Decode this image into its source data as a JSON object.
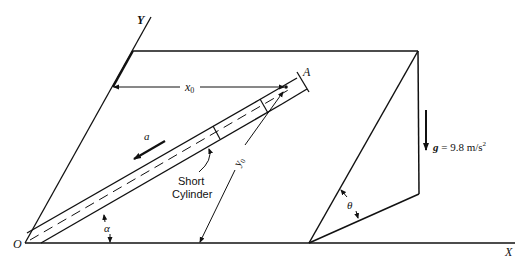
{
  "diagram": {
    "axes": {
      "y_label": "Y",
      "x_label": "X",
      "origin_label": "O"
    },
    "labels": {
      "point_a": "A",
      "x0": "x",
      "x0_sub": "0",
      "y0": "y",
      "y0_sub": "0",
      "accel": "a",
      "cylinder_line1": "Short",
      "cylinder_line2": "Cylinder",
      "alpha": "α",
      "theta": "θ",
      "gravity_g": "g",
      "gravity_eq": " = 9.8 m/s",
      "gravity_sup": "2"
    },
    "colors": {
      "stroke": "#111111",
      "background": "#ffffff"
    }
  }
}
